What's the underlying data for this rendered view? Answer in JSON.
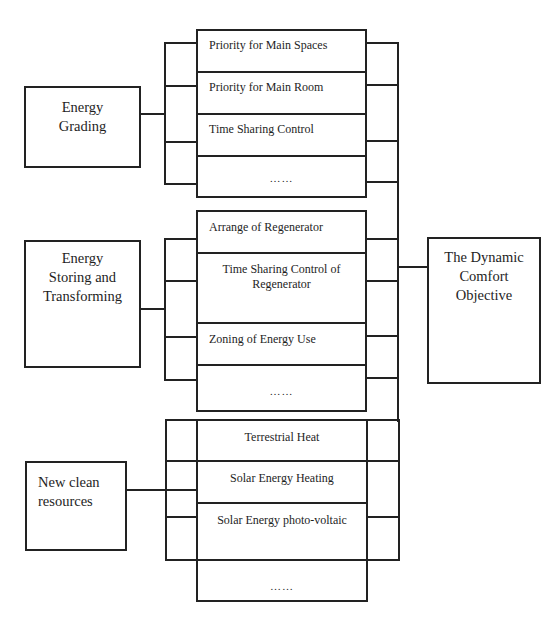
{
  "diagram": {
    "groups": [
      {
        "source": "Energy Grading",
        "items": [
          "Priority for Main Spaces",
          "Priority for Main Room",
          "Time Sharing Control",
          "……"
        ]
      },
      {
        "source": "Energy Storing and Transforming",
        "source_lines": [
          "Energy",
          "Storing and",
          "Transforming"
        ],
        "items": [
          "Arrange of Regenerator",
          "Time Sharing Control of Regenerator",
          "Zoning of Energy Use",
          "……"
        ],
        "item2_lines": [
          "Time Sharing Control of",
          "Regenerator"
        ]
      },
      {
        "source": "New clean resources",
        "source_lines": [
          "New clean",
          "resources"
        ],
        "items": [
          "Terrestrial Heat",
          "Solar Energy Heating",
          "Solar Energy photo-voltaic",
          "……"
        ]
      }
    ],
    "target": {
      "label": "The Dynamic Comfort Objective",
      "lines": [
        "The Dynamic",
        "Comfort",
        "Objective"
      ]
    },
    "grading_lines": [
      "Energy",
      "Grading"
    ]
  }
}
